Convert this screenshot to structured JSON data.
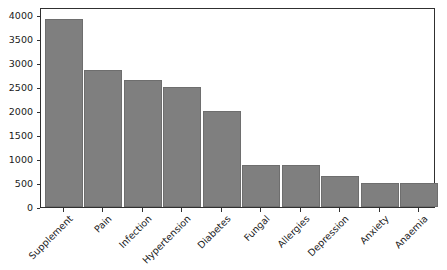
{
  "chart_data": {
    "type": "bar",
    "title": "",
    "xlabel": "",
    "ylabel": "",
    "categories": [
      "Supplement",
      "Pain",
      "Infection",
      "Hypertension",
      "Diabetes",
      "Fungal",
      "Allergies",
      "Depression",
      "Anxiety",
      "Anaemia"
    ],
    "values": [
      3920,
      2845,
      2650,
      2500,
      2000,
      880,
      870,
      645,
      505,
      495
    ],
    "ylim": [
      0,
      4000
    ],
    "yticks": [
      0,
      500,
      1000,
      1500,
      2000,
      2500,
      3000,
      3500,
      4000
    ],
    "ytick_labels": [
      "0",
      "500",
      "1000",
      "1500",
      "2000",
      "2500",
      "3000",
      "3500",
      "4000"
    ],
    "grid": false,
    "legend": null,
    "bar_color": "#7f7f7f",
    "bar_edge_color": "#6e6e6e",
    "axis_color": "#303030",
    "background_color": "#ffffff",
    "xtick_rotation": -45
  }
}
